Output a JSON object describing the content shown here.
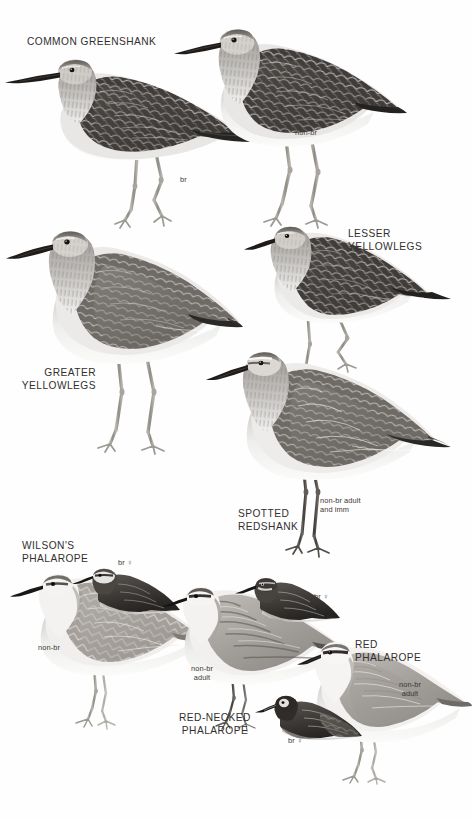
{
  "plate": {
    "width": 472,
    "height": 819,
    "background": "#fefefe",
    "ink": "#332f2e",
    "medium": "grayscale pencil and wash illustration"
  },
  "species": [
    {
      "id": "common-greenshank",
      "name": "COMMON GREENSHANK",
      "figures": [
        {
          "id": "greenshank-br",
          "label": "br"
        },
        {
          "id": "greenshank-nonbr",
          "label": "non-br"
        }
      ]
    },
    {
      "id": "greater-yellowlegs",
      "name": "GREATER\nYELLOWLEGS",
      "figures": [
        {
          "id": "greater-yellowlegs-fig",
          "label": ""
        }
      ]
    },
    {
      "id": "lesser-yellowlegs",
      "name": "LESSER\nYELLOWLEGS",
      "figures": [
        {
          "id": "lesser-yellowlegs-fig",
          "label": ""
        }
      ]
    },
    {
      "id": "spotted-redshank",
      "name": "SPOTTED\nREDSHANK",
      "figures": [
        {
          "id": "spotted-redshank-fig",
          "label": "non-br adult\nand imm"
        }
      ]
    },
    {
      "id": "wilsons-phalarope",
      "name": "WILSON'S\nPHALAROPE",
      "figures": [
        {
          "id": "wilsons-nonbr",
          "label": "non-br"
        },
        {
          "id": "wilsons-br-female",
          "label": "br ♀"
        }
      ]
    },
    {
      "id": "red-necked-phalarope",
      "name": "RED-NECKED\nPHALAROPE",
      "figures": [
        {
          "id": "rednecked-nonbr-adult",
          "label": "non-br\nadult"
        },
        {
          "id": "rednecked-br-female",
          "label": "br ♀"
        }
      ]
    },
    {
      "id": "red-phalarope",
      "name": "RED\nPHALAROPE",
      "figures": [
        {
          "id": "red-phalarope-nonbr-adult",
          "label": "non-br\nadult"
        },
        {
          "id": "red-phalarope-br-female",
          "label": "br ♀"
        }
      ]
    }
  ],
  "labels": {
    "common_greenshank": "COMMON GREENSHANK",
    "greenshank_br": "br",
    "greenshank_nonbr": "non-br",
    "greater_yellowlegs": "GREATER\nYELLOWLEGS",
    "lesser_yellowlegs": "LESSER\nYELLOWLEGS",
    "spotted_redshank": "SPOTTED\nREDSHANK",
    "spotted_redshank_note": "non-br adult\nand imm",
    "wilsons_phalarope": "WILSON'S\nPHALAROPE",
    "wilsons_nonbr": "non-br",
    "wilsons_br_female": "br ♀",
    "red_necked_phalarope": "RED-NECKED\nPHALAROPE",
    "red_necked_nonbr_adult": "non-br\nadult",
    "red_necked_br_female": "br ♀",
    "red_phalarope": "RED\nPHALAROPE",
    "red_phalarope_nonbr_adult": "non-br\nadult",
    "red_phalarope_br_female": "br ♀"
  }
}
